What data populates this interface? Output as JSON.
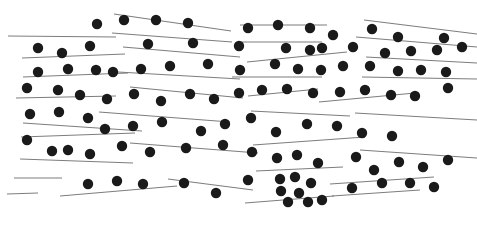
{
  "canvas": {
    "width": 477,
    "height": 228,
    "background": "#ffffff",
    "title": "Abstract scatter pattern of filled dots over thin sloped rules"
  },
  "style": {
    "dot_color": "#1a1a1a",
    "dot_radius": 5.2,
    "line_color": "#7d7d7d",
    "line_width": 1.1
  },
  "chart_data": {
    "type": "scatter",
    "title": "",
    "subtitle": "",
    "xlabel": "",
    "ylabel": "",
    "grid": false,
    "legend_position": "none",
    "xlim": [
      0,
      477
    ],
    "ylim": [
      0,
      228
    ],
    "y_axis_inverted": true,
    "marker": {
      "shape": "circle",
      "filled": true,
      "color": "#1a1a1a",
      "radius": 5.2
    },
    "point_count": 101,
    "points": [
      [
        97,
        24
      ],
      [
        124,
        20
      ],
      [
        156,
        20
      ],
      [
        188,
        23
      ],
      [
        248,
        28
      ],
      [
        278,
        25
      ],
      [
        310,
        28
      ],
      [
        333,
        35
      ],
      [
        372,
        29
      ],
      [
        398,
        37
      ],
      [
        444,
        38
      ],
      [
        38,
        48
      ],
      [
        62,
        53
      ],
      [
        90,
        46
      ],
      [
        148,
        44
      ],
      [
        193,
        43
      ],
      [
        239,
        46
      ],
      [
        286,
        48
      ],
      [
        310,
        50
      ],
      [
        322,
        48
      ],
      [
        353,
        47
      ],
      [
        385,
        53
      ],
      [
        411,
        51
      ],
      [
        437,
        50
      ],
      [
        462,
        47
      ],
      [
        38,
        72
      ],
      [
        68,
        69
      ],
      [
        96,
        70
      ],
      [
        113,
        72
      ],
      [
        141,
        69
      ],
      [
        170,
        66
      ],
      [
        208,
        64
      ],
      [
        240,
        70
      ],
      [
        275,
        64
      ],
      [
        298,
        69
      ],
      [
        321,
        70
      ],
      [
        343,
        66
      ],
      [
        370,
        66
      ],
      [
        398,
        71
      ],
      [
        421,
        70
      ],
      [
        446,
        72
      ],
      [
        27,
        88
      ],
      [
        58,
        90
      ],
      [
        80,
        95
      ],
      [
        107,
        99
      ],
      [
        134,
        94
      ],
      [
        161,
        101
      ],
      [
        190,
        94
      ],
      [
        214,
        99
      ],
      [
        239,
        93
      ],
      [
        262,
        90
      ],
      [
        287,
        89
      ],
      [
        313,
        93
      ],
      [
        340,
        92
      ],
      [
        365,
        90
      ],
      [
        391,
        95
      ],
      [
        415,
        96
      ],
      [
        448,
        88
      ],
      [
        30,
        114
      ],
      [
        59,
        112
      ],
      [
        88,
        118
      ],
      [
        105,
        129
      ],
      [
        133,
        126
      ],
      [
        162,
        122
      ],
      [
        201,
        131
      ],
      [
        225,
        124
      ],
      [
        251,
        118
      ],
      [
        276,
        132
      ],
      [
        307,
        124
      ],
      [
        337,
        126
      ],
      [
        362,
        133
      ],
      [
        392,
        136
      ],
      [
        27,
        140
      ],
      [
        52,
        151
      ],
      [
        68,
        150
      ],
      [
        90,
        154
      ],
      [
        122,
        146
      ],
      [
        150,
        152
      ],
      [
        186,
        148
      ],
      [
        223,
        145
      ],
      [
        252,
        152
      ],
      [
        277,
        158
      ],
      [
        297,
        155
      ],
      [
        318,
        163
      ],
      [
        356,
        157
      ],
      [
        374,
        170
      ],
      [
        399,
        162
      ],
      [
        423,
        167
      ],
      [
        448,
        160
      ],
      [
        88,
        184
      ],
      [
        117,
        181
      ],
      [
        143,
        184
      ],
      [
        184,
        183
      ],
      [
        216,
        193
      ],
      [
        248,
        180
      ],
      [
        280,
        179
      ],
      [
        295,
        177
      ],
      [
        311,
        183
      ],
      [
        281,
        191
      ],
      [
        299,
        193
      ],
      [
        288,
        202
      ],
      [
        308,
        202
      ],
      [
        322,
        200
      ],
      [
        352,
        188
      ],
      [
        382,
        183
      ],
      [
        410,
        183
      ],
      [
        434,
        187
      ]
    ],
    "line_count": 30,
    "lines": [
      {
        "x1": 8,
        "y1": 36,
        "x2": 116,
        "y2": 37
      },
      {
        "x1": 114,
        "y1": 14,
        "x2": 231,
        "y2": 31
      },
      {
        "x1": 240,
        "y1": 25,
        "x2": 327,
        "y2": 25
      },
      {
        "x1": 364,
        "y1": 20,
        "x2": 477,
        "y2": 34
      },
      {
        "x1": 112,
        "y1": 33,
        "x2": 232,
        "y2": 42
      },
      {
        "x1": 240,
        "y1": 42,
        "x2": 322,
        "y2": 42
      },
      {
        "x1": 356,
        "y1": 37,
        "x2": 477,
        "y2": 47
      },
      {
        "x1": 22,
        "y1": 58,
        "x2": 125,
        "y2": 54
      },
      {
        "x1": 123,
        "y1": 47,
        "x2": 240,
        "y2": 57
      },
      {
        "x1": 247,
        "y1": 62,
        "x2": 347,
        "y2": 52
      },
      {
        "x1": 366,
        "y1": 57,
        "x2": 477,
        "y2": 63
      },
      {
        "x1": 23,
        "y1": 77,
        "x2": 128,
        "y2": 73
      },
      {
        "x1": 118,
        "y1": 72,
        "x2": 240,
        "y2": 79
      },
      {
        "x1": 232,
        "y1": 77,
        "x2": 322,
        "y2": 77
      },
      {
        "x1": 362,
        "y1": 77,
        "x2": 477,
        "y2": 79
      },
      {
        "x1": 16,
        "y1": 98,
        "x2": 116,
        "y2": 96
      },
      {
        "x1": 130,
        "y1": 87,
        "x2": 243,
        "y2": 98
      },
      {
        "x1": 248,
        "y1": 96,
        "x2": 318,
        "y2": 89
      },
      {
        "x1": 319,
        "y1": 102,
        "x2": 415,
        "y2": 93
      },
      {
        "x1": 23,
        "y1": 123,
        "x2": 142,
        "y2": 131
      },
      {
        "x1": 99,
        "y1": 112,
        "x2": 230,
        "y2": 122
      },
      {
        "x1": 251,
        "y1": 111,
        "x2": 350,
        "y2": 116
      },
      {
        "x1": 355,
        "y1": 113,
        "x2": 477,
        "y2": 120
      },
      {
        "x1": 21,
        "y1": 137,
        "x2": 135,
        "y2": 133
      },
      {
        "x1": 20,
        "y1": 159,
        "x2": 133,
        "y2": 163
      },
      {
        "x1": 130,
        "y1": 143,
        "x2": 258,
        "y2": 153
      },
      {
        "x1": 253,
        "y1": 145,
        "x2": 365,
        "y2": 137
      },
      {
        "x1": 360,
        "y1": 150,
        "x2": 477,
        "y2": 158
      },
      {
        "x1": 60,
        "y1": 196,
        "x2": 177,
        "y2": 186
      },
      {
        "x1": 168,
        "y1": 179,
        "x2": 253,
        "y2": 190
      },
      {
        "x1": 256,
        "y1": 171,
        "x2": 343,
        "y2": 167
      },
      {
        "x1": 330,
        "y1": 184,
        "x2": 434,
        "y2": 177
      },
      {
        "x1": 332,
        "y1": 196,
        "x2": 420,
        "y2": 190
      },
      {
        "x1": 245,
        "y1": 203,
        "x2": 334,
        "y2": 196
      },
      {
        "x1": 14,
        "y1": 178,
        "x2": 62,
        "y2": 178
      },
      {
        "x1": 7,
        "y1": 194,
        "x2": 38,
        "y2": 193
      }
    ]
  }
}
